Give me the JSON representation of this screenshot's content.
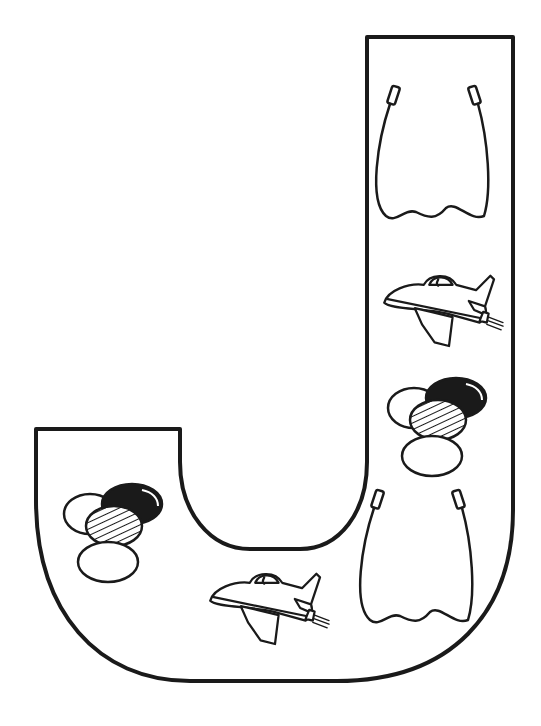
{
  "page": {
    "letter": "J",
    "items": [
      {
        "name": "jump rope",
        "count": 2
      },
      {
        "name": "jet airplane",
        "count": 2
      },
      {
        "name": "jelly beans",
        "count": 2
      }
    ]
  },
  "colors": {
    "line": "#1a1a1a",
    "background": "#ffffff"
  }
}
